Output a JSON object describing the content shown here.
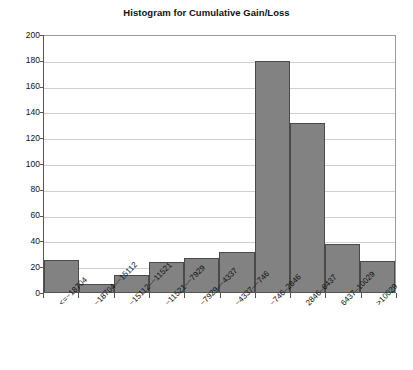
{
  "chart_data": {
    "type": "bar",
    "title": "Histogram for Cumulative Gain/Loss",
    "xlabel": "",
    "ylabel": "",
    "ylim": [
      0,
      200
    ],
    "ytick_step": 20,
    "grid": true,
    "legend": "none",
    "orientation": "vertical",
    "bar_color": "#828282",
    "bar_edge_color": "#4a4a4a",
    "categories": [
      "<=−18704",
      "−18704–−15112",
      "−15112–−11521",
      "−11521–−7929",
      "−7929–−4337",
      "−4337–−746",
      "−746–2846",
      "2846–6437",
      "6437–10029",
      ">10029"
    ],
    "values": [
      25,
      6,
      13,
      23,
      26,
      31,
      179,
      131,
      37,
      24
    ],
    "ytick_labels": [
      "0",
      "20",
      "40",
      "60",
      "80",
      "100",
      "120",
      "140",
      "160",
      "180",
      "200"
    ]
  }
}
